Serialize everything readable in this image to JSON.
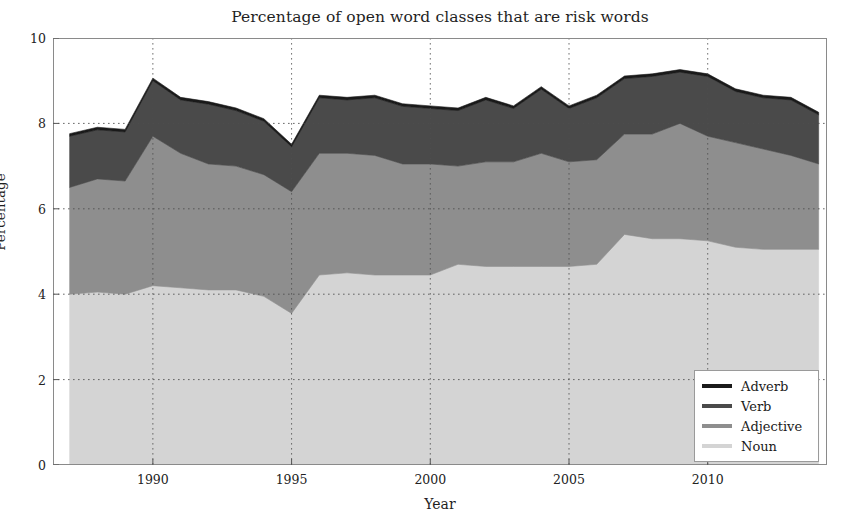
{
  "chart_data": {
    "type": "area",
    "title": "Percentage of open word classes that are risk words",
    "xlabel": "Year",
    "ylabel": "Percentage",
    "xlim": [
      1986.4,
      2014.3
    ],
    "ylim": [
      0,
      10
    ],
    "xticks": [
      1990,
      1995,
      2000,
      2005,
      2010
    ],
    "yticks": [
      0,
      2,
      4,
      6,
      8,
      10
    ],
    "grid": true,
    "stacked": true,
    "legend_position": "lower right",
    "legend_order_top_to_bottom": [
      "Adverb",
      "Verb",
      "Adjective",
      "Noun"
    ],
    "x": [
      1987,
      1988,
      1989,
      1990,
      1991,
      1992,
      1993,
      1994,
      1995,
      1996,
      1997,
      1998,
      1999,
      2000,
      2001,
      2002,
      2003,
      2004,
      2005,
      2006,
      2007,
      2008,
      2009,
      2010,
      2011,
      2012,
      2013,
      2014
    ],
    "series": [
      {
        "name": "Noun",
        "color": "#d4d4d4",
        "values": [
          4.0,
          4.05,
          4.0,
          4.2,
          4.15,
          4.1,
          4.1,
          3.95,
          3.55,
          4.45,
          4.5,
          4.45,
          4.45,
          4.45,
          4.7,
          4.65,
          4.65,
          4.65,
          4.65,
          4.7,
          5.4,
          5.3,
          5.3,
          5.25,
          5.1,
          5.05,
          5.05,
          5.05
        ]
      },
      {
        "name": "Adjective",
        "color": "#8e8e8e",
        "values": [
          2.5,
          2.65,
          2.65,
          3.5,
          3.15,
          2.95,
          2.9,
          2.85,
          2.85,
          2.85,
          2.8,
          2.8,
          2.6,
          2.6,
          2.3,
          2.45,
          2.45,
          2.65,
          2.45,
          2.45,
          2.35,
          2.45,
          2.7,
          2.45,
          2.45,
          2.35,
          2.2,
          2.0
        ]
      },
      {
        "name": "Verb",
        "color": "#4a4a4a",
        "values": [
          1.2,
          1.15,
          1.15,
          1.3,
          1.25,
          1.4,
          1.3,
          1.25,
          1.05,
          1.3,
          1.25,
          1.35,
          1.35,
          1.3,
          1.3,
          1.45,
          1.25,
          1.5,
          1.25,
          1.45,
          1.3,
          1.35,
          1.2,
          1.4,
          1.2,
          1.2,
          1.3,
          1.15
        ]
      },
      {
        "name": "Adverb",
        "color": "#1a1a1a",
        "values": [
          0.06,
          0.06,
          0.06,
          0.06,
          0.06,
          0.06,
          0.06,
          0.06,
          0.06,
          0.06,
          0.06,
          0.06,
          0.06,
          0.06,
          0.06,
          0.06,
          0.06,
          0.06,
          0.06,
          0.06,
          0.06,
          0.06,
          0.06,
          0.06,
          0.06,
          0.06,
          0.06,
          0.06
        ]
      }
    ],
    "totals": [
      7.76,
      7.91,
      7.86,
      9.06,
      8.61,
      8.51,
      8.36,
      8.11,
      7.51,
      8.66,
      8.61,
      8.66,
      8.46,
      8.41,
      8.36,
      8.61,
      8.41,
      8.86,
      8.41,
      8.66,
      9.11,
      9.16,
      9.26,
      9.16,
      8.81,
      8.66,
      8.61,
      8.26
    ]
  },
  "legend": {
    "items": [
      {
        "label": "Adverb",
        "color": "#1a1a1a"
      },
      {
        "label": "Verb",
        "color": "#4a4a4a"
      },
      {
        "label": "Adjective",
        "color": "#8e8e8e"
      },
      {
        "label": "Noun",
        "color": "#d4d4d4"
      }
    ]
  },
  "axes": {
    "y_tick_labels": [
      "10",
      "8",
      "6",
      "4",
      "2",
      "0"
    ],
    "x_tick_labels": [
      "1990",
      "1995",
      "2000",
      "2005",
      "2010"
    ]
  }
}
